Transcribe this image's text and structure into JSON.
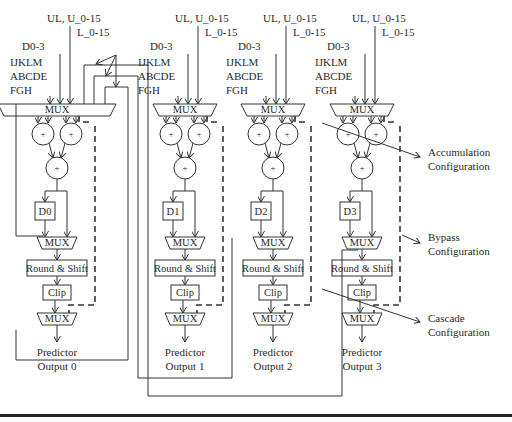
{
  "diagram": {
    "type": "block-diagram",
    "inputs": {
      "ul_u": "UL, U_0-15",
      "l": "L_0-15",
      "d": "D0-3",
      "ijklm": "IJKLM",
      "abcde": "ABCDE",
      "fgh": "FGH"
    },
    "blocks": {
      "mux": "MUX",
      "plus": "+",
      "round_shift": "Round & Shift",
      "clip": "Clip"
    },
    "lanes": [
      {
        "delay": "D0",
        "output_line1": "Predictor",
        "output_line2": "Output 0"
      },
      {
        "delay": "D1",
        "output_line1": "Predictor",
        "output_line2": "Output 1"
      },
      {
        "delay": "D2",
        "output_line1": "Predictor",
        "output_line2": "Output 2"
      },
      {
        "delay": "D3",
        "output_line1": "Predictor",
        "output_line2": "Output 3"
      }
    ],
    "annotations": {
      "accumulation_1": "Accumulation",
      "accumulation_2": "Configuration",
      "bypass_1": "Bypass",
      "bypass_2": "Configuration",
      "cascade_1": "Cascade",
      "cascade_2": "Configuration"
    }
  }
}
